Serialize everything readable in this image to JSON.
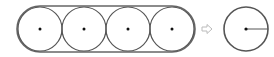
{
  "diagram": {
    "colors": {
      "stroke": "#555555",
      "band_stroke": "#666666",
      "dot": "#111111",
      "arrow": "#bbbbbb",
      "background": "#ffffff"
    },
    "stadium": {
      "x1": 40,
      "x2": 172,
      "cy": 29,
      "r": 23
    },
    "circles": [
      {
        "id": "circle-1",
        "cx": 40,
        "cy": 29,
        "r": 22
      },
      {
        "id": "circle-2",
        "cx": 84,
        "cy": 29,
        "r": 22
      },
      {
        "id": "circle-3",
        "cx": 128,
        "cy": 29,
        "r": 22
      },
      {
        "id": "circle-4",
        "cx": 172,
        "cy": 29,
        "r": 22
      }
    ],
    "arrow": {
      "x": 202,
      "y": 29,
      "label": "transforms to"
    },
    "result_circle": {
      "cx": 246,
      "cy": 29,
      "r": 22,
      "radius_line": true
    }
  }
}
